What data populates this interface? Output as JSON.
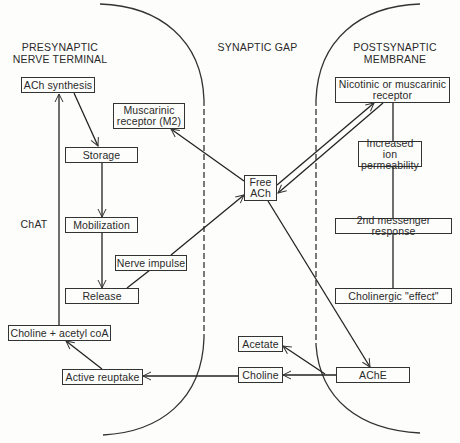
{
  "diagram": {
    "regions": {
      "presynaptic": "PRESYNAPTIC\nNERVE TERMINAL",
      "gap": "SYNAPTIC GAP",
      "postsynaptic": "POSTSYNAPTIC\nMEMBRANE"
    },
    "side_label": "ChAT",
    "nodes": {
      "ach_synthesis": "ACh synthesis",
      "storage": "Storage",
      "mobilization": "Mobilization",
      "release": "Release",
      "nerve_impulse": "Nerve impulse",
      "muscarinic_m2": "Muscarinic\nreceptor (M2)",
      "free_ach": "Free\nACh",
      "receptor": "Nicotinic or muscarinic\nreceptor",
      "ion_permeability": "Increased ion\npermeability",
      "second_messenger": "2nd messenger response",
      "cholinergic_effect": "Cholinergic \"effect\"",
      "ache": "AChE",
      "acetate": "Acetate",
      "choline": "Choline",
      "active_reuptake": "Active reuptake",
      "choline_acetyl_coa": "Choline + acetyl coA"
    },
    "edges": [
      {
        "from": "ACh synthesis",
        "to": "Storage"
      },
      {
        "from": "Storage",
        "to": "Mobilization"
      },
      {
        "from": "Mobilization",
        "to": "Release"
      },
      {
        "from": "Nerve impulse",
        "to": "Release"
      },
      {
        "from": "Release",
        "to": "Free ACh"
      },
      {
        "from": "Free ACh",
        "to": "Muscarinic receptor (M2)"
      },
      {
        "from": "Free ACh",
        "to": "Nicotinic or muscarinic receptor"
      },
      {
        "from": "Nicotinic or muscarinic receptor",
        "to": "Free ACh"
      },
      {
        "from": "Nicotinic or muscarinic receptor",
        "to": "Increased ion permeability"
      },
      {
        "from": "Increased ion permeability",
        "to": "2nd messenger response"
      },
      {
        "from": "2nd messenger response",
        "to": "Cholinergic \"effect\""
      },
      {
        "from": "Free ACh",
        "to": "AChE"
      },
      {
        "from": "AChE",
        "to": "Acetate"
      },
      {
        "from": "AChE",
        "to": "Choline"
      },
      {
        "from": "Choline",
        "to": "Active reuptake"
      },
      {
        "from": "Active reuptake",
        "to": "Choline + acetyl coA"
      },
      {
        "from": "Choline + acetyl coA",
        "to": "ACh synthesis",
        "label": "ChAT"
      }
    ]
  }
}
